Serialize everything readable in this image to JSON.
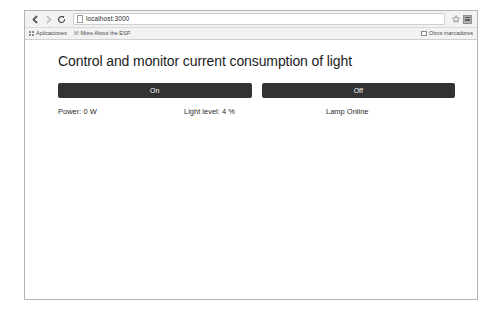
{
  "browser": {
    "toolbar": {
      "back_icon": "back-arrow-icon",
      "forward_icon": "forward-arrow-icon",
      "reload_icon": "reload-icon",
      "url_value": "localhost:3000",
      "url_scheme_host": "localhost",
      "url_port": ":3000",
      "page_icon": "page-document-icon",
      "star_glyph": "☆",
      "star_icon": "bookmark-star-icon",
      "menu_icon": "chrome-menu-icon"
    },
    "bookmarks_bar": {
      "items": [
        {
          "label": "Aplicaciones",
          "icon": "apps-grid-icon"
        },
        {
          "label": "More About the ESP",
          "icon": "bookmark-m-icon",
          "glyph": "M"
        }
      ],
      "other_bookmarks_label": "Otros marcadores",
      "other_bookmarks_icon": "folder-icon"
    }
  },
  "page": {
    "title": "Control and monitor current consumption of light",
    "buttons": [
      {
        "label": "On",
        "name": "lamp-on-button"
      },
      {
        "label": "Off",
        "name": "lamp-off-button"
      }
    ],
    "status": {
      "power": "Power: 0 W",
      "light_level": "Light level: 4 %",
      "lamp_state": "Lamp Online"
    }
  },
  "colors": {
    "button_background": "#333333",
    "button_text": "#ffffff",
    "page_background": "#ffffff",
    "chrome_background": "#f2f2f2",
    "window_border": "#b4b4b4"
  }
}
